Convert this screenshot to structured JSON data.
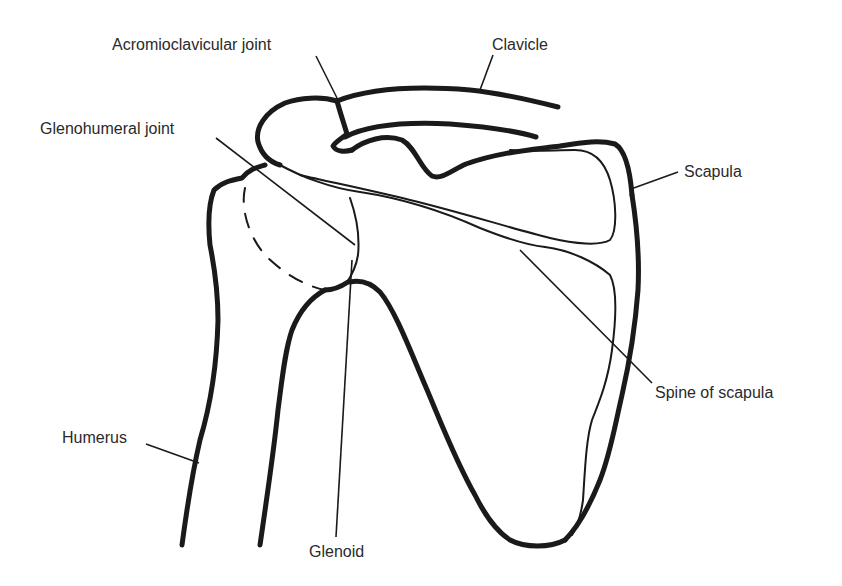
{
  "diagram": {
    "labels": {
      "acromioclavicular_joint": "Acromioclavicular joint",
      "clavicle": "Clavicle",
      "glenohumeral_joint": "Glenohumeral joint",
      "scapula": "Scapula",
      "spine_of_scapula": "Spine of scapula",
      "humerus": "Humerus",
      "glenoid": "Glenoid"
    },
    "colors": {
      "line": "#1a1a1a",
      "text": "#2a2a2a",
      "background": "#ffffff"
    }
  }
}
